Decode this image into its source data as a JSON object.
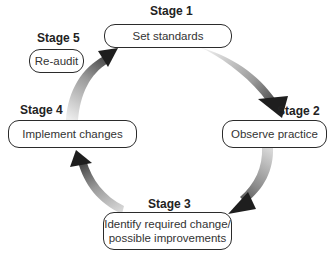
{
  "diagram": {
    "type": "cycle",
    "stages": [
      {
        "id": 1,
        "label": "Stage 1",
        "text": "Set standards"
      },
      {
        "id": 2,
        "label": "Stage 2",
        "text": "Observe practice"
      },
      {
        "id": 3,
        "label": "Stage 3",
        "text": "Identify required change/ possible improvements",
        "text_lines": [
          "Identify required change/",
          "possible improvements"
        ]
      },
      {
        "id": 4,
        "label": "Stage 4",
        "text": "Implement changes"
      },
      {
        "id": 5,
        "label": "Stage 5",
        "text": "Re-audit"
      }
    ],
    "arrows": [
      {
        "from": 1,
        "to": 2
      },
      {
        "from": 2,
        "to": 3
      },
      {
        "from": 3,
        "to": 4
      },
      {
        "from": 4,
        "to": 1
      }
    ],
    "colors": {
      "box_border": "#2b2b2b",
      "arrow_light": "#e6e6e6",
      "arrow_dark": "#222222",
      "text": "#333333"
    }
  }
}
